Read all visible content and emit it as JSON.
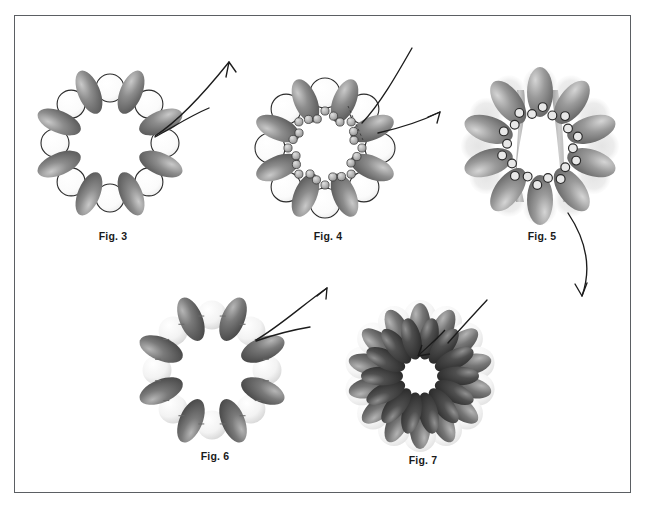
{
  "sheet": {
    "title": "Patent drawing sheet - ring assembly figures",
    "background_color": "#ffffff",
    "border_color": "#5b5f63"
  },
  "figures": [
    {
      "id": "fig3",
      "label": "Fig. 3",
      "caption_x": 101,
      "caption_y": 243,
      "center_x": 110,
      "center_y": 145,
      "ring_radius": 58,
      "unit_count": 8,
      "description": "Ring of eight shaded ellipsoid subunits alternating with eight open outlined circles",
      "ellipse_fill_dark": "#6e6e6e",
      "ellipse_fill_light": "#b9b9b9",
      "circle_stroke": "#2b2b2b",
      "circle_fill": "#fdfdfd",
      "has_beads": false,
      "has_halo": false
    },
    {
      "id": "fig4",
      "label": "Fig. 4",
      "caption_x": 318,
      "caption_y": 243,
      "center_x": 325,
      "center_y": 148,
      "ring_radius": 58,
      "unit_count": 8,
      "description": "Ring of eight ellipsoid subunits with outlined circles plus inner chains of small beads",
      "ellipse_fill_dark": "#6e6e6e",
      "ellipse_fill_light": "#b9b9b9",
      "circle_stroke": "#2b2b2b",
      "circle_fill": "#fdfdfd",
      "bead_fill": "#b0b0b0",
      "bead_stroke": "#3a3a3a",
      "bead_count": 24,
      "has_beads": true,
      "has_halo": false,
      "dashed_marker": true
    },
    {
      "id": "fig5",
      "label": "Fig. 5",
      "caption_x": 534,
      "caption_y": 243,
      "center_x": 540,
      "center_y": 148,
      "ring_radius": 56,
      "unit_count": 10,
      "description": "Ring of ten ellipsoid subunits with open ring links, pale halo discs behind, and two vertical rod structures spanning the lumen",
      "ellipse_fill_dark": "#7a7a7a",
      "ellipse_fill_light": "#c4c4c4",
      "halo_fill": "#e2e2e2",
      "link_stroke": "#2b2b2b",
      "link_fill": "#e8e8e8",
      "rod_fill": "#a8a8a8",
      "link_count": 20,
      "rod_count": 2,
      "has_beads": true,
      "has_halo": true
    },
    {
      "id": "fig6",
      "label": "Fig. 6",
      "caption_x": 203,
      "caption_y": 466,
      "center_x": 212,
      "center_y": 372,
      "ring_radius": 58,
      "unit_count": 8,
      "description": "Ring of eight dark ellipsoid subunits alternating with eight pale unfilled spheres",
      "ellipse_fill_dark": "#5a5a5a",
      "ellipse_fill_light": "#9a9a9a",
      "sphere_fill": "#f2f2f2",
      "sphere_shade": "#d8d8d8",
      "has_beads": false,
      "has_halo": false
    },
    {
      "id": "fig7",
      "label": "Fig. 7",
      "caption_x": 413,
      "caption_y": 466,
      "center_x": 420,
      "center_y": 378,
      "ring_radius": 62,
      "unit_count": 14,
      "description": "Dense rosette of fourteen dark ellipsoid subunits in two overlapping rings over pale spheres, with an arrow pointing into the central pore",
      "ellipse_fill_dark": "#3d3d3d",
      "ellipse_fill_light": "#8a8a8a",
      "sphere_fill": "#f4f4f4",
      "inner_arrow": true,
      "has_beads": false,
      "has_halo": true
    }
  ],
  "connectors": [
    {
      "id": "arrow-fig3-up",
      "from": "fig3",
      "type": "curved-arrow",
      "direction": "up-right",
      "has_arrowhead": true
    },
    {
      "id": "leader-fig3",
      "from": "fig3",
      "type": "leader-line",
      "has_arrowhead": false
    },
    {
      "id": "leader-fig4",
      "from": "fig4",
      "type": "leader-line",
      "direction": "up-right",
      "has_arrowhead": false
    },
    {
      "id": "arrow-fig4-fig5",
      "from": "fig4",
      "to": "fig5",
      "type": "straight-arrow",
      "direction": "right",
      "has_arrowhead": true
    },
    {
      "id": "arrow-fig5-fig7",
      "from": "fig5",
      "to": "fig7",
      "type": "curved-arrow",
      "direction": "down",
      "has_arrowhead": true
    },
    {
      "id": "arrow-fig6-up",
      "from": "fig6",
      "type": "curved-arrow",
      "direction": "up-right",
      "has_arrowhead": true
    },
    {
      "id": "leader-fig6",
      "from": "fig6",
      "type": "leader-line",
      "has_arrowhead": false
    },
    {
      "id": "leader-fig7",
      "to": "fig7",
      "type": "leader-line",
      "direction": "down-left",
      "has_arrowhead": false
    }
  ]
}
